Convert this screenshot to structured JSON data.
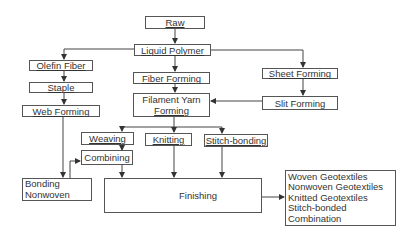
{
  "diagram": {
    "type": "flowchart",
    "nodes": [
      {
        "id": "raw",
        "label": "Raw"
      },
      {
        "id": "liquid_polymer",
        "label": "Liquid Polymer"
      },
      {
        "id": "olefin_fiber",
        "label": "Olefin Fiber"
      },
      {
        "id": "staple",
        "label": "Staple"
      },
      {
        "id": "web_forming",
        "label": "Web Forming"
      },
      {
        "id": "fiber_forming",
        "label": "Fiber Forming"
      },
      {
        "id": "filament_yarn_forming",
        "label": "Filament Yarn Forming",
        "lines": [
          "Filament Yarn",
          "Forming"
        ]
      },
      {
        "id": "sheet_forming",
        "label": "Sheet Forming"
      },
      {
        "id": "slit_forming",
        "label": "Slit Forming"
      },
      {
        "id": "weaving",
        "label": "Weaving"
      },
      {
        "id": "knitting",
        "label": "Knitting"
      },
      {
        "id": "stitch_bonding",
        "label": "Stitch-bonding"
      },
      {
        "id": "combining",
        "label": "Combining"
      },
      {
        "id": "bonding_nonwoven",
        "label": "Bonding Nonwoven",
        "lines": [
          "Bonding",
          "Nonwoven"
        ]
      },
      {
        "id": "finishing",
        "label": "Finishing"
      },
      {
        "id": "products",
        "label": "Products",
        "lines": [
          "Woven Geotextiles",
          "Nonwoven Geotextiles",
          "Knitted Geotextiles",
          "Stitch-bonded",
          "Combination"
        ]
      }
    ],
    "edges": [
      {
        "from": "raw",
        "to": "liquid_polymer"
      },
      {
        "from": "liquid_polymer",
        "to": "olefin_fiber"
      },
      {
        "from": "liquid_polymer",
        "to": "fiber_forming"
      },
      {
        "from": "liquid_polymer",
        "to": "sheet_forming"
      },
      {
        "from": "olefin_fiber",
        "to": "staple"
      },
      {
        "from": "staple",
        "to": "web_forming"
      },
      {
        "from": "fiber_forming",
        "to": "filament_yarn_forming"
      },
      {
        "from": "sheet_forming",
        "to": "slit_forming"
      },
      {
        "from": "slit_forming",
        "to": "filament_yarn_forming"
      },
      {
        "from": "filament_yarn_forming",
        "to": "weaving"
      },
      {
        "from": "filament_yarn_forming",
        "to": "knitting"
      },
      {
        "from": "filament_yarn_forming",
        "to": "stitch_bonding"
      },
      {
        "from": "weaving",
        "to": "combining"
      },
      {
        "from": "web_forming",
        "to": "bonding_nonwoven"
      },
      {
        "from": "bonding_nonwoven",
        "to": "combining"
      },
      {
        "from": "combining",
        "to": "finishing"
      },
      {
        "from": "knitting",
        "to": "finishing"
      },
      {
        "from": "stitch_bonding",
        "to": "finishing"
      },
      {
        "from": "finishing",
        "to": "products"
      }
    ]
  }
}
